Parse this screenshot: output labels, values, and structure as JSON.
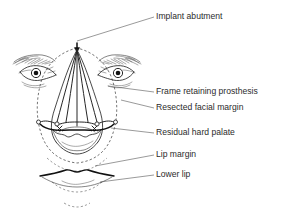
{
  "figure": {
    "background_color": "#ffffff",
    "ink_color": "#1a1a1a",
    "label_color": "#2b2b2b",
    "leader_color": "#555555"
  },
  "labels": [
    {
      "id": "implant-abutment",
      "text": "Implant abutment",
      "x": 156,
      "y": 17,
      "leader_from_x": 77,
      "leader_from_y": 41,
      "leader_to_x": 154,
      "leader_to_y": 17
    },
    {
      "id": "frame-retaining-prosthesis",
      "text": "Frame retaining prosthesis",
      "x": 156,
      "y": 92,
      "leader_from_x": 108,
      "leader_from_y": 86,
      "leader_to_x": 154,
      "leader_to_y": 92
    },
    {
      "id": "resected-facial-margin",
      "text": "Resected facial margin",
      "x": 156,
      "y": 108,
      "leader_from_x": 121,
      "leader_from_y": 100,
      "leader_to_x": 154,
      "leader_to_y": 108
    },
    {
      "id": "residual-hard-palate",
      "text": "Residual hard palate",
      "x": 156,
      "y": 133,
      "leader_from_x": 111,
      "leader_from_y": 128,
      "leader_to_x": 154,
      "leader_to_y": 133
    },
    {
      "id": "lip-margin",
      "text": "Lip margin",
      "x": 156,
      "y": 155,
      "leader_from_x": 95,
      "leader_from_y": 166,
      "leader_to_x": 154,
      "leader_to_y": 155
    },
    {
      "id": "lower-lip",
      "text": "Lower lip",
      "x": 156,
      "y": 175,
      "leader_from_x": 100,
      "leader_from_y": 182,
      "leader_to_x": 154,
      "leader_to_y": 175
    }
  ],
  "anatomy": {
    "abutment": {
      "cx": 77,
      "cy": 41,
      "r": 2.2
    },
    "left_eye": {
      "cx": 36,
      "cy": 71
    },
    "right_eye": {
      "cx": 118,
      "cy": 71
    },
    "frame_apex": {
      "x": 77,
      "y": 48
    },
    "frame_bar_y": 125,
    "midline_x": 77
  }
}
